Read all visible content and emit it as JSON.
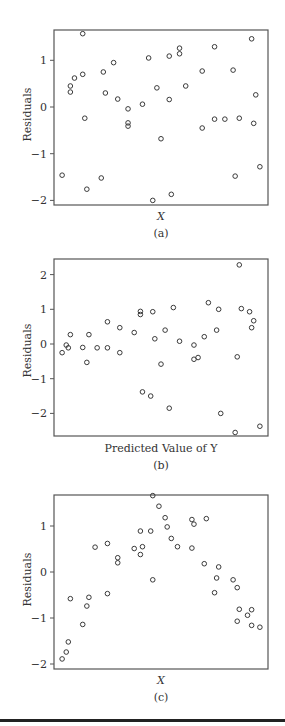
{
  "chart_data": [
    {
      "type": "scatter",
      "panel": "(a)",
      "title": "",
      "xlabel": "X",
      "ylabel": "Residuals",
      "caption": "(a)",
      "yticks": [
        1,
        0,
        -1,
        -2
      ],
      "ylim": [
        -2.1,
        1.65
      ],
      "x_ticks_shown": false,
      "grid": false,
      "points": [
        [
          0.02,
          -1.46
        ],
        [
          0.06,
          0.45
        ],
        [
          0.06,
          0.32
        ],
        [
          0.08,
          0.62
        ],
        [
          0.12,
          0.7
        ],
        [
          0.12,
          1.57
        ],
        [
          0.13,
          -0.24
        ],
        [
          0.14,
          -1.76
        ],
        [
          0.21,
          -1.52
        ],
        [
          0.22,
          0.75
        ],
        [
          0.23,
          0.3
        ],
        [
          0.27,
          0.95
        ],
        [
          0.29,
          0.17
        ],
        [
          0.34,
          -0.34
        ],
        [
          0.34,
          -0.04
        ],
        [
          0.34,
          -0.41
        ],
        [
          0.41,
          0.06
        ],
        [
          0.44,
          1.05
        ],
        [
          0.46,
          -2.0
        ],
        [
          0.48,
          0.41
        ],
        [
          0.5,
          -0.68
        ],
        [
          0.54,
          0.16
        ],
        [
          0.54,
          1.09
        ],
        [
          0.55,
          -1.87
        ],
        [
          0.59,
          1.14
        ],
        [
          0.59,
          1.26
        ],
        [
          0.62,
          0.45
        ],
        [
          0.7,
          0.77
        ],
        [
          0.7,
          -0.45
        ],
        [
          0.76,
          1.29
        ],
        [
          0.76,
          -0.26
        ],
        [
          0.81,
          -0.26
        ],
        [
          0.85,
          0.79
        ],
        [
          0.86,
          -1.48
        ],
        [
          0.88,
          -0.24
        ],
        [
          0.94,
          1.46
        ],
        [
          0.95,
          -0.35
        ],
        [
          0.96,
          0.26
        ],
        [
          0.98,
          -1.28
        ]
      ]
    },
    {
      "type": "scatter",
      "panel": "(b)",
      "title": "",
      "xlabel": "Predicted Value of Y",
      "ylabel": "Residuals",
      "caption": "(b)",
      "yticks": [
        2,
        1,
        0,
        -1,
        -2
      ],
      "ylim": [
        -2.65,
        2.45
      ],
      "x_ticks_shown": false,
      "grid": false,
      "points": [
        [
          0.02,
          -0.25
        ],
        [
          0.04,
          -0.03
        ],
        [
          0.05,
          -0.11
        ],
        [
          0.06,
          0.27
        ],
        [
          0.12,
          -0.1
        ],
        [
          0.14,
          -0.53
        ],
        [
          0.15,
          0.27
        ],
        [
          0.19,
          -0.11
        ],
        [
          0.24,
          0.64
        ],
        [
          0.24,
          -0.11
        ],
        [
          0.3,
          0.47
        ],
        [
          0.3,
          -0.25
        ],
        [
          0.37,
          0.33
        ],
        [
          0.4,
          0.94
        ],
        [
          0.4,
          0.85
        ],
        [
          0.41,
          -1.38
        ],
        [
          0.45,
          -1.5
        ],
        [
          0.46,
          0.93
        ],
        [
          0.47,
          0.15
        ],
        [
          0.5,
          -0.58
        ],
        [
          0.52,
          0.4
        ],
        [
          0.54,
          -1.85
        ],
        [
          0.56,
          1.05
        ],
        [
          0.59,
          0.08
        ],
        [
          0.66,
          -0.03
        ],
        [
          0.66,
          -0.44
        ],
        [
          0.68,
          -0.39
        ],
        [
          0.71,
          0.21
        ],
        [
          0.73,
          1.19
        ],
        [
          0.77,
          0.4
        ],
        [
          0.78,
          1.0
        ],
        [
          0.79,
          -2.0
        ],
        [
          0.86,
          -2.55
        ],
        [
          0.87,
          -0.37
        ],
        [
          0.88,
          2.28
        ],
        [
          0.89,
          1.02
        ],
        [
          0.93,
          0.93
        ],
        [
          0.94,
          0.47
        ],
        [
          0.95,
          0.67
        ],
        [
          0.98,
          -2.37
        ]
      ]
    },
    {
      "type": "scatter",
      "panel": "(c)",
      "title": "",
      "xlabel": "X",
      "ylabel": "Residuals",
      "caption": "(c)",
      "yticks": [
        1,
        0,
        -1,
        -2
      ],
      "ylim": [
        -2.1,
        1.68
      ],
      "x_ticks_shown": false,
      "grid": false,
      "points": [
        [
          0.02,
          -1.89
        ],
        [
          0.04,
          -1.74
        ],
        [
          0.05,
          -1.52
        ],
        [
          0.06,
          -0.58
        ],
        [
          0.12,
          -1.14
        ],
        [
          0.14,
          -0.74
        ],
        [
          0.15,
          -0.55
        ],
        [
          0.18,
          0.54
        ],
        [
          0.24,
          -0.47
        ],
        [
          0.24,
          0.62
        ],
        [
          0.29,
          0.31
        ],
        [
          0.29,
          0.2
        ],
        [
          0.37,
          0.51
        ],
        [
          0.4,
          0.89
        ],
        [
          0.4,
          0.38
        ],
        [
          0.41,
          0.55
        ],
        [
          0.45,
          0.89
        ],
        [
          0.46,
          1.66
        ],
        [
          0.46,
          -0.17
        ],
        [
          0.49,
          1.43
        ],
        [
          0.52,
          1.18
        ],
        [
          0.53,
          0.98
        ],
        [
          0.55,
          0.73
        ],
        [
          0.58,
          0.55
        ],
        [
          0.65,
          1.14
        ],
        [
          0.66,
          1.04
        ],
        [
          0.65,
          0.52
        ],
        [
          0.72,
          1.16
        ],
        [
          0.71,
          0.18
        ],
        [
          0.76,
          -0.45
        ],
        [
          0.77,
          -0.13
        ],
        [
          0.78,
          0.11
        ],
        [
          0.85,
          -0.17
        ],
        [
          0.87,
          -1.07
        ],
        [
          0.87,
          -0.34
        ],
        [
          0.88,
          -0.81
        ],
        [
          0.92,
          -0.94
        ],
        [
          0.94,
          -0.82
        ],
        [
          0.94,
          -1.16
        ],
        [
          0.98,
          -1.2
        ]
      ]
    }
  ],
  "panels": {
    "a": {
      "ylabel": "Residuals",
      "xlabel": "X",
      "caption": "(a)",
      "ticks": [
        "1",
        "0",
        "−1",
        "−2"
      ]
    },
    "b": {
      "ylabel": "Residuals",
      "xlabel": "Predicted Value of Y",
      "caption": "(b)",
      "ticks": [
        "2",
        "1",
        "0",
        "−1",
        "−2"
      ]
    },
    "c": {
      "ylabel": "Residuals",
      "xlabel": "X",
      "caption": "(c)",
      "ticks": [
        "1",
        "0",
        "−1",
        "−2"
      ]
    }
  },
  "colors": {
    "axis": "#555555",
    "marker": "#3a3a3a",
    "text": "#333333",
    "rule": "#222222"
  }
}
